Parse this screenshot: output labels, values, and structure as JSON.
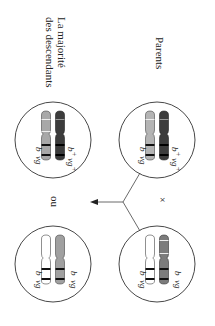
{
  "diagram": {
    "orientation": "rotated 90° clockwise",
    "labels": {
      "parents": "Parents",
      "offspring_line1": "La majorité",
      "offspring_line2": "des descendants",
      "cross_symbol": "×",
      "or_text": "ou"
    },
    "colors": {
      "light_grey": "#b4b4b4",
      "dark_grey": "#3c3c3c",
      "mid_grey": "#8c8c8c",
      "white": "#ffffff",
      "band": "#111111",
      "outline": "#333333"
    },
    "circles": [
      {
        "id": "parent-1",
        "role": "parent",
        "chromosomes": [
          {
            "fill": "light_grey",
            "genes": [
              "b",
              "vg"
            ]
          },
          {
            "fill": "dark_grey",
            "genes": [
              "b+",
              "vg+"
            ]
          }
        ]
      },
      {
        "id": "parent-2",
        "role": "parent",
        "chromosomes": [
          {
            "fill": "white",
            "genes": [
              "b",
              "vg"
            ]
          },
          {
            "fill": "mid_grey",
            "genes": [
              "b",
              "vg"
            ]
          }
        ]
      },
      {
        "id": "offspring-1",
        "role": "offspring",
        "chromosomes": [
          {
            "fill": "light_grey",
            "genes": [
              "b",
              "vg"
            ]
          },
          {
            "fill": "dark_grey",
            "genes": [
              "b+",
              "vg+"
            ]
          }
        ]
      },
      {
        "id": "offspring-2",
        "role": "offspring",
        "chromosomes": [
          {
            "fill": "white",
            "genes": [
              "b",
              "vg"
            ]
          },
          {
            "fill": "mid_grey",
            "genes": [
              "b",
              "vg"
            ]
          }
        ]
      }
    ],
    "gene_text": {
      "b": "b",
      "vg": "vg",
      "b_plus": "b",
      "vg_plus": "vg",
      "plus": "+"
    }
  }
}
